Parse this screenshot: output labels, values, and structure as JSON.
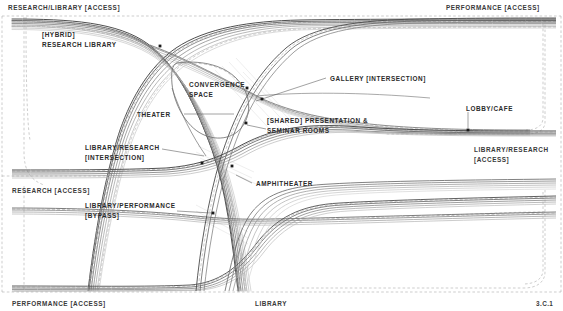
{
  "sheet": {
    "number": "3.C.1",
    "title": "LIBRARY"
  },
  "edge_labels": [
    {
      "id": "research-library-access",
      "text": "RESEARCH/LIBRARY [ACCESS]",
      "x": 8,
      "y": 6,
      "align": "left"
    },
    {
      "id": "performance-access-top",
      "text": "PERFORMANCE [ACCESS]",
      "x": 446,
      "y": 6,
      "align": "left"
    },
    {
      "id": "research-access-left",
      "text": "RESEARCH [ACCESS]",
      "x": 12,
      "y": 189,
      "align": "left"
    },
    {
      "id": "library-research-access-right",
      "text": "LIBRARY/RESEARCH\n[ACCESS]",
      "x": 474,
      "y": 148,
      "align": "left"
    },
    {
      "id": "performance-access-bottom",
      "text": "PERFORMANCE [ACCESS]",
      "x": 12,
      "y": 301,
      "align": "left"
    },
    {
      "id": "library-bottom",
      "text": "LIBRARY",
      "x": 255,
      "y": 301,
      "align": "left"
    },
    {
      "id": "sheet-number",
      "text": "3.C.1",
      "x": 536,
      "y": 301,
      "align": "left"
    }
  ],
  "program_labels": [
    {
      "id": "hybrid-research-library",
      "text": "[HYBRID]\nRESEARCH LIBRARY",
      "x": 42,
      "y": 32
    },
    {
      "id": "convergence-space",
      "text": "CONVERGENCE\nSPACE",
      "x": 189,
      "y": 82
    },
    {
      "id": "gallery-intersection",
      "text": "GALLERY [INTERSECTION]",
      "x": 330,
      "y": 76
    },
    {
      "id": "theater",
      "text": "THEATER",
      "x": 137,
      "y": 112
    },
    {
      "id": "shared-presentation-seminar",
      "text": "[SHARED] PRESENTATION &\nSEMINAR ROOMS",
      "x": 267,
      "y": 118
    },
    {
      "id": "lobby-cafe",
      "text": "LOBBY/CAFE",
      "x": 466,
      "y": 106
    },
    {
      "id": "library-research-intersection",
      "text": "LIBRARY/RESEARCH\n[INTERSECTION]",
      "x": 85,
      "y": 145
    },
    {
      "id": "amphitheater",
      "text": "AMPHITHEATER",
      "x": 256,
      "y": 181
    },
    {
      "id": "library-performance-bypass",
      "text": "LIBRARY/PERFORMANCE\n[BYPASS]",
      "x": 85,
      "y": 203
    }
  ],
  "nodes": [
    {
      "id": "node-hybrid-research-library",
      "x": 160,
      "y": 46
    },
    {
      "id": "node-convergence-space",
      "x": 247,
      "y": 88
    },
    {
      "id": "node-gallery-intersection",
      "x": 262,
      "y": 99
    },
    {
      "id": "node-shared-presentation",
      "x": 246,
      "y": 123
    },
    {
      "id": "node-lobby-cafe",
      "x": 468,
      "y": 130
    },
    {
      "id": "node-library-research-intersection",
      "x": 202,
      "y": 163
    },
    {
      "id": "node-amphitheater-a",
      "x": 232,
      "y": 166
    },
    {
      "id": "node-library-performance-bypass",
      "x": 213,
      "y": 213
    }
  ],
  "leaders": [
    {
      "id": "leader-gallery",
      "x1": 256,
      "y1": 101,
      "x2": 326,
      "y2": 78
    },
    {
      "id": "leader-lobby-cafe",
      "x1": 468,
      "y1": 129,
      "x2": 468,
      "y2": 111
    },
    {
      "id": "leader-theater",
      "x1": 182,
      "y1": 114,
      "x2": 232,
      "y2": 114
    },
    {
      "id": "leader-library-research-int",
      "x1": 160,
      "y1": 148,
      "x2": 206,
      "y2": 153
    },
    {
      "id": "leader-amphitheater",
      "x1": 252,
      "y1": 183,
      "x2": 237,
      "y2": 176
    },
    {
      "id": "leader-bypass",
      "x1": 176,
      "y1": 211,
      "x2": 212,
      "y2": 213
    },
    {
      "id": "leader-shared-presentation",
      "x1": 265,
      "y1": 128,
      "x2": 246,
      "y2": 124
    }
  ],
  "colors": {
    "ink": "#2b2b2b",
    "line_dark": "#4a4a4a",
    "line_mid": "#8c8c8c",
    "line_light": "#c3c3c3",
    "boundary": "#a9a9a9",
    "background": "#ffffff"
  },
  "diagram": {
    "type": "circulation-flow-bundle"
  }
}
